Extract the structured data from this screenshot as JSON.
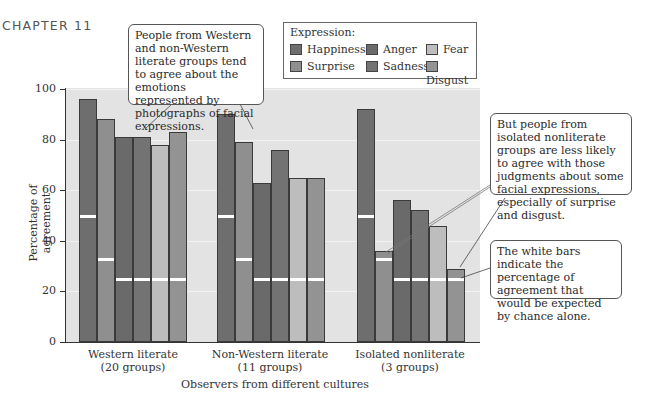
{
  "header": {
    "chapter": "CHAPTER 11"
  },
  "legend": {
    "title": "Expression:",
    "items": [
      {
        "label": "Happiness",
        "color": "#6e6e6e"
      },
      {
        "label": "Anger",
        "color": "#6a6a6a"
      },
      {
        "label": "Fear",
        "color": "#bdbdbd"
      },
      {
        "label": "Surprise",
        "color": "#8f8f8f"
      },
      {
        "label": "Sadness",
        "color": "#737373"
      },
      {
        "label": "Disgust",
        "color": "#939393"
      }
    ]
  },
  "callouts": {
    "top": "People from Western and non-Western literate groups tend to agree about the emotions represented by photographs of facial expressions.",
    "right": "But people from isolated nonliterate groups are less likely to agree with those judgments about some facial expressions, especially of surprise and disgust.",
    "bottom": "The white bars indicate the percentage of agreement that would be expected by chance alone."
  },
  "axis": {
    "ylabel": "Percentage of agreement",
    "yticks": [
      "0",
      "20",
      "40",
      "60",
      "80",
      "100"
    ],
    "xlabel": "Observers from different cultures",
    "categories": [
      {
        "line1": "Western literate",
        "line2": "(20 groups)"
      },
      {
        "line1": "Non-Western literate",
        "line2": "(11 groups)"
      },
      {
        "line1": "Isolated nonliterate",
        "line2": "(3 groups)"
      }
    ]
  },
  "chart_data": {
    "type": "bar",
    "title": "",
    "xlabel": "Observers from different cultures",
    "ylabel": "Percentage of agreement",
    "ylim": [
      0,
      100
    ],
    "grid": true,
    "legend_position": "top-right (boxed)",
    "categories": [
      "Western literate (20 groups)",
      "Non-Western literate (11 groups)",
      "Isolated nonliterate (3 groups)"
    ],
    "series": [
      {
        "name": "Happiness",
        "values": [
          96,
          90,
          92
        ],
        "chance": 50
      },
      {
        "name": "Surprise",
        "values": [
          88,
          79,
          36
        ],
        "chance": 33
      },
      {
        "name": "Anger",
        "values": [
          81,
          63,
          56
        ],
        "chance": 25
      },
      {
        "name": "Sadness",
        "values": [
          81,
          76,
          52
        ],
        "chance": 25
      },
      {
        "name": "Fear",
        "values": [
          78,
          65,
          46
        ],
        "chance": 25
      },
      {
        "name": "Disgust",
        "values": [
          83,
          65,
          29
        ],
        "chance": 25
      }
    ],
    "annotations": [
      "People from Western and non-Western literate groups tend to agree about the emotions represented by photographs of facial expressions.",
      "But people from isolated nonliterate groups are less likely to agree with those judgments about some facial expressions, especially of surprise and disgust.",
      "The white bars indicate the percentage of agreement that would be expected by chance alone."
    ]
  }
}
